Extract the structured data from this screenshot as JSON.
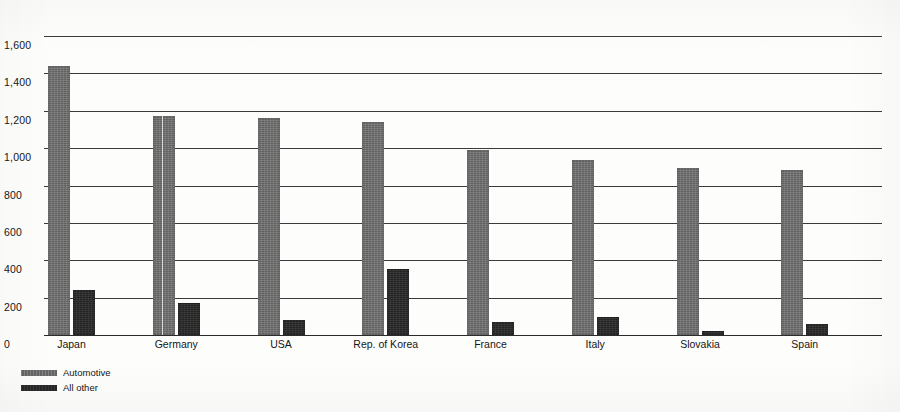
{
  "chart_data": {
    "type": "bar",
    "title": "",
    "subtitle": "",
    "xlabel": "",
    "ylabel": "",
    "ylim": [
      0,
      1600
    ],
    "yticks": [
      0,
      200,
      400,
      600,
      800,
      1000,
      1200,
      1400,
      1600
    ],
    "ytick_labels": [
      "0",
      "200",
      "400",
      "600",
      "800",
      "1,000",
      "1,200",
      "1,400",
      "1,600"
    ],
    "grid": true,
    "legend_position": "bottom-left",
    "categories": [
      "Japan",
      "Germany",
      "USA",
      "Rep. of Korea",
      "France",
      "Italy",
      "Slovakia",
      "Spain"
    ],
    "series": [
      {
        "name": "Automotive",
        "color": "#6d6d6d",
        "values": [
          1440,
          1170,
          1160,
          1140,
          990,
          935,
          895,
          885
        ]
      },
      {
        "name": "All other",
        "color": "#2b2b2b",
        "values": [
          240,
          170,
          80,
          355,
          70,
          95,
          20,
          60
        ]
      }
    ]
  },
  "legend": {
    "items": [
      {
        "label": "Automotive",
        "swatch": "automotive"
      },
      {
        "label": "All other",
        "swatch": "allother"
      }
    ]
  }
}
